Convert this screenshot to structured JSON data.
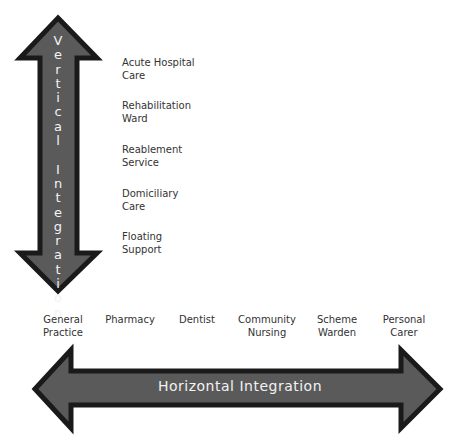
{
  "vertical_axis": {
    "label": "Vertical Integration",
    "letters": [
      "V",
      "e",
      "r",
      "t",
      "i",
      "c",
      "a",
      "l",
      " ",
      "I",
      "n",
      "t",
      "e",
      "g",
      "r",
      "a",
      "t",
      "i",
      "o",
      "n"
    ],
    "items": [
      {
        "line1": "Acute Hospital",
        "line2": "Care"
      },
      {
        "line1": "Rehabilitation",
        "line2": "Ward"
      },
      {
        "line1": "Reablement",
        "line2": "Service"
      },
      {
        "line1": "Domiciliary",
        "line2": "Care"
      },
      {
        "line1": "Floating",
        "line2": "Support"
      }
    ]
  },
  "horizontal_axis": {
    "label": "Horizontal Integration",
    "items": [
      {
        "line1": "General",
        "line2": "Practice"
      },
      {
        "line1": "Pharmacy",
        "line2": ""
      },
      {
        "line1": "Dentist",
        "line2": ""
      },
      {
        "line1": "Community",
        "line2": "Nursing"
      },
      {
        "line1": "Scheme",
        "line2": "Warden"
      },
      {
        "line1": "Personal",
        "line2": "Carer"
      }
    ]
  },
  "colors": {
    "arrow_fill": "#5a5a5a",
    "arrow_outline": "#1a1a1a",
    "arrow_text": "#f2f2f2",
    "label_text": "#333333"
  }
}
